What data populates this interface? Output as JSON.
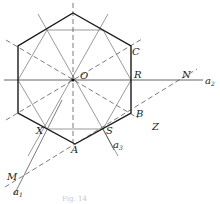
{
  "figure": {
    "labels": {
      "O": "O",
      "C": "C",
      "R": "R",
      "N": "N",
      "a2": "a",
      "a2_sub": "2",
      "B": "B",
      "Z": "Z",
      "S": "S",
      "a3": "a",
      "a3_sub": "3",
      "X": "X",
      "A": "A",
      "M": "M",
      "a1": "a",
      "a1_sub": "1"
    },
    "caption": "Fig. 14"
  },
  "colors": {
    "ink": "#1a1a1a",
    "thin": "#3a3a3a",
    "background": "#ffffff"
  }
}
